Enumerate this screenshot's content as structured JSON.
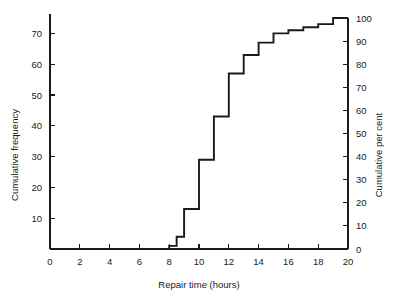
{
  "chart_data": {
    "type": "line",
    "subtype": "cumulative-frequency-ogive-step",
    "title": "",
    "xlabel": "Repair time (hours)",
    "ylabel": "Cumulative frequency",
    "y2label": "Cumulative per cent",
    "xlim": [
      0,
      20
    ],
    "ylim": [
      0,
      75
    ],
    "y2lim": [
      0,
      100
    ],
    "grid": false,
    "legend": null,
    "xticks": [
      0,
      2,
      4,
      6,
      8,
      10,
      12,
      14,
      16,
      18,
      20
    ],
    "xticklabels": [
      "0",
      "2",
      "4",
      "6",
      "8",
      "10",
      "12",
      "14",
      "16",
      "18",
      "20"
    ],
    "yticks": [
      10,
      20,
      30,
      40,
      50,
      60,
      70
    ],
    "yticklabels": [
      "10",
      "20",
      "30",
      "40",
      "50",
      "60",
      "70"
    ],
    "y2ticks": [
      0,
      10,
      20,
      30,
      40,
      50,
      60,
      70,
      80,
      90,
      100
    ],
    "y2ticklabels": [
      "0",
      "10",
      "20",
      "30",
      "40",
      "50",
      "60",
      "70",
      "80",
      "90",
      "100"
    ],
    "series": [
      {
        "name": "Cumulative frequency",
        "step": "post",
        "x": [
          7.5,
          8.0,
          8.5,
          9.0,
          9.5,
          10.0,
          10.5,
          11.0,
          11.5,
          12.0,
          12.5,
          13.0,
          13.5,
          14.0,
          14.5,
          15.0,
          15.5,
          16.0,
          16.5,
          17.0,
          17.5,
          18.0,
          18.5,
          19.0,
          19.5,
          20.0
        ],
        "values": [
          0,
          1,
          1,
          4,
          4,
          13,
          13,
          29,
          29,
          43,
          43,
          57,
          57,
          63,
          63,
          67,
          67,
          70,
          70,
          71,
          71,
          72,
          72,
          73,
          73,
          75
        ],
        "values_percent": [
          0,
          1.3,
          1.3,
          5.3,
          5.3,
          17.3,
          17.3,
          38.7,
          38.7,
          57.3,
          57.3,
          76.0,
          76.0,
          84.0,
          84.0,
          89.3,
          89.3,
          93.3,
          93.3,
          94.7,
          94.7,
          96.0,
          96.0,
          97.3,
          97.3,
          100.0
        ]
      }
    ],
    "steps": [
      {
        "x_start": 7.5,
        "x_end": 8.0,
        "frequency": 0,
        "percent": 0
      },
      {
        "x_start": 8.0,
        "x_end": 8.5,
        "frequency": 1,
        "percent": 1
      },
      {
        "x_start": 8.5,
        "x_end": 9.0,
        "frequency": 4,
        "percent": 5
      },
      {
        "x_start": 9.0,
        "x_end": 10.0,
        "frequency": 13,
        "percent": 17
      },
      {
        "x_start": 10.0,
        "x_end": 11.0,
        "frequency": 29,
        "percent": 39
      },
      {
        "x_start": 11.0,
        "x_end": 12.0,
        "frequency": 43,
        "percent": 57
      },
      {
        "x_start": 12.0,
        "x_end": 13.0,
        "frequency": 57,
        "percent": 76
      },
      {
        "x_start": 13.0,
        "x_end": 14.0,
        "frequency": 63,
        "percent": 84
      },
      {
        "x_start": 14.0,
        "x_end": 15.0,
        "frequency": 67,
        "percent": 89
      },
      {
        "x_start": 15.0,
        "x_end": 16.0,
        "frequency": 70,
        "percent": 93
      },
      {
        "x_start": 16.0,
        "x_end": 17.0,
        "frequency": 71,
        "percent": 95
      },
      {
        "x_start": 17.0,
        "x_end": 18.0,
        "frequency": 72,
        "percent": 96
      },
      {
        "x_start": 18.0,
        "x_end": 19.0,
        "frequency": 73,
        "percent": 97
      },
      {
        "x_start": 19.0,
        "x_end": 20.0,
        "frequency": 75,
        "percent": 100
      }
    ],
    "colors": {
      "curve": "#1a1a1a",
      "axis": "#1a1a1a",
      "text": "#1a1a1a",
      "background": "#ffffff"
    }
  }
}
